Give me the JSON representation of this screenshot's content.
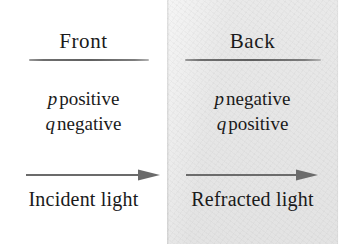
{
  "figure": {
    "background_color": "#ffffff",
    "medium": {
      "name": "shaded-medium-region",
      "fill_color": "#e6e6e6",
      "left_px": 167,
      "width_px": 171
    },
    "text_color": "#1a1a1a",
    "rule_color": "#5f5f5f",
    "arrow_color": "#6b6b6b"
  },
  "front": {
    "heading": "Front",
    "signs": [
      {
        "variable": "p",
        "sign": "positive"
      },
      {
        "variable": "q",
        "sign": "negative"
      }
    ],
    "ray_caption": "Incident light",
    "arrow_direction": "right"
  },
  "back": {
    "heading": "Back",
    "signs": [
      {
        "variable": "p",
        "sign": "negative"
      },
      {
        "variable": "q",
        "sign": "positive"
      }
    ],
    "ray_caption": "Refracted light",
    "arrow_direction": "right"
  }
}
